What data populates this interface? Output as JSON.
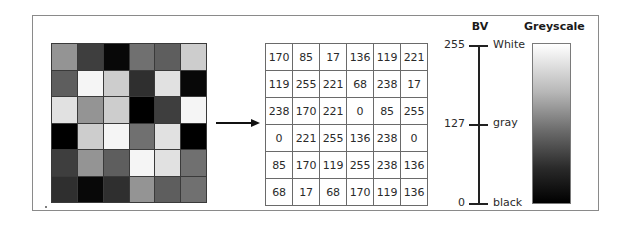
{
  "figure": {
    "image_grid": {
      "rows": 6,
      "cols": 6,
      "values": [
        [
          170,
          85,
          17,
          136,
          119,
          221
        ],
        [
          119,
          255,
          221,
          68,
          238,
          17
        ],
        [
          238,
          170,
          221,
          0,
          85,
          255
        ],
        [
          0,
          221,
          255,
          136,
          238,
          0
        ],
        [
          85,
          170,
          119,
          255,
          238,
          136
        ],
        [
          68,
          17,
          68,
          170,
          119,
          136
        ]
      ]
    },
    "arrow": {
      "direction": "right"
    },
    "value_table": {
      "rows": [
        [
          "170",
          "85",
          "17",
          "136",
          "119",
          "221"
        ],
        [
          "119",
          "255",
          "221",
          "68",
          "238",
          "17"
        ],
        [
          "238",
          "170",
          "221",
          "0",
          "85",
          "255"
        ],
        [
          "0",
          "221",
          "255",
          "136",
          "238",
          "0"
        ],
        [
          "85",
          "170",
          "119",
          "255",
          "238",
          "136"
        ],
        [
          "68",
          "17",
          "68",
          "170",
          "119",
          "136"
        ]
      ]
    },
    "bv_scale": {
      "title": "BV",
      "ticks": [
        {
          "value": "255",
          "label": "White"
        },
        {
          "value": "127",
          "label": "gray"
        },
        {
          "value": "0",
          "label": "black"
        }
      ]
    },
    "greyscale": {
      "title": "Greyscale",
      "top_color": "#ffffff",
      "bottom_color": "#000000"
    }
  }
}
